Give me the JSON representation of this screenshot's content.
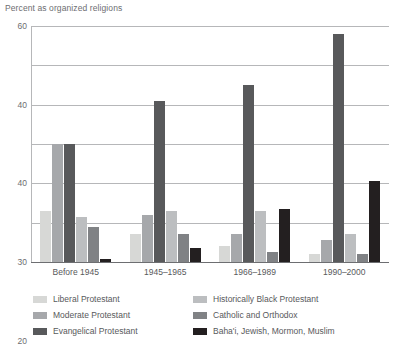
{
  "chart_data": {
    "type": "bar",
    "title": "Percent as organized religions",
    "xlabel": "",
    "ylabel": "",
    "ylim": [
      0,
      60
    ],
    "ytick_labels": [
      "60",
      "40",
      "40",
      "30",
      "20",
      "10",
      "0"
    ],
    "ytick_values": [
      60,
      50,
      40,
      30,
      20,
      10,
      0
    ],
    "grid": true,
    "legend_position": "bottom",
    "categories": [
      "Before 1945",
      "1945–1965",
      "1966–1989",
      "1990–2000"
    ],
    "series": [
      {
        "name": "Liberal Protestant",
        "color": "#d7d8d6",
        "values": [
          13,
          7,
          4,
          2
        ]
      },
      {
        "name": "Moderate Protestant",
        "color": "#a6a8ab",
        "values": [
          30,
          12,
          7,
          5.5
        ]
      },
      {
        "name": "Evangelical Protestant",
        "color": "#58595b",
        "values": [
          30,
          41,
          45,
          58
        ]
      },
      {
        "name": "Historically Black Protestant",
        "color": "#bcbec0",
        "values": [
          11.5,
          13,
          13,
          7
        ]
      },
      {
        "name": "Catholic and Orthodox",
        "color": "#808285",
        "values": [
          9,
          7,
          2.5,
          2
        ]
      },
      {
        "name": "Baha'i, Jewish, Mormon, Muslim",
        "color": "#231f20",
        "values": [
          0.8,
          3.5,
          13.5,
          20.5
        ]
      }
    ]
  }
}
